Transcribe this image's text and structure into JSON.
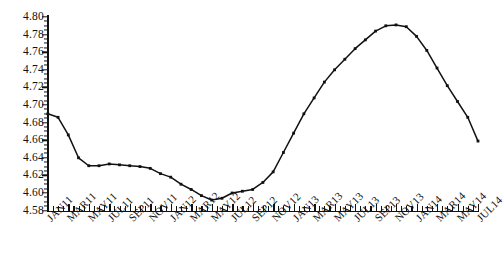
{
  "chart_data": {
    "type": "line",
    "title": "",
    "xlabel": "",
    "ylabel": "",
    "ylim": [
      4.58,
      4.8
    ],
    "ytick_step": 0.02,
    "grid": false,
    "legend": "none",
    "marker": "square",
    "line_color": "#111111",
    "x": [
      "JAN11",
      "FEB11",
      "MAR11",
      "APR11",
      "MAY11",
      "JUN11",
      "JUL11",
      "AUG11",
      "SEP11",
      "OCT11",
      "NOV11",
      "DEC11",
      "JAN12",
      "FEB12",
      "MAR12",
      "APR12",
      "MAY12",
      "JUN12",
      "JUL12",
      "AUG12",
      "SEP12",
      "OCT12",
      "NOV12",
      "DEC12",
      "JAN13",
      "FEB13",
      "MAR13",
      "APR13",
      "MAY13",
      "JUN13",
      "JUL13",
      "AUG13",
      "SEP13",
      "OCT13",
      "NOV13",
      "DEC13",
      "JAN14",
      "FEB14",
      "MAR14",
      "APR14",
      "MAY14",
      "JUN14",
      "JUL14"
    ],
    "values": [
      4.69,
      4.686,
      4.666,
      4.64,
      4.631,
      4.631,
      4.633,
      4.632,
      4.631,
      4.63,
      4.628,
      4.622,
      4.618,
      4.61,
      4.604,
      4.597,
      4.592,
      4.594,
      4.6,
      4.602,
      4.604,
      4.612,
      4.624,
      4.646,
      4.668,
      4.69,
      4.708,
      4.726,
      4.74,
      4.752,
      4.764,
      4.774,
      4.784,
      4.79,
      4.791,
      4.789,
      4.778,
      4.762,
      4.742,
      4.722,
      4.704,
      4.686,
      4.659
    ],
    "xtick_labels": [
      "JAN11",
      "MAR11",
      "MAY11",
      "JUL11",
      "SEP11",
      "NOV11",
      "JAN12",
      "MAR12",
      "MAY12",
      "JUL12",
      "SEP12",
      "NOV12",
      "JAN13",
      "MAR13",
      "MAY13",
      "JUL13",
      "SEP13",
      "NOV13",
      "JAN14",
      "MAR14",
      "MAY14",
      "JUL14"
    ],
    "ytick_labels": [
      "4.80",
      "4.78",
      "4.76",
      "4.74",
      "4.72",
      "4.70",
      "4.68",
      "4.66",
      "4.64",
      "4.62",
      "4.60",
      "4.58"
    ]
  }
}
